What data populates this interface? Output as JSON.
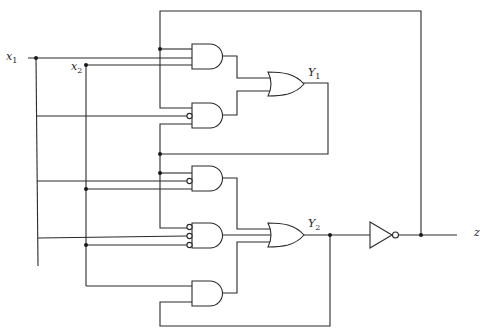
{
  "diagram": {
    "type": "logic-circuit",
    "inputs": [
      {
        "id": "x1",
        "name": "x",
        "sub": "1"
      },
      {
        "id": "x2",
        "name": "x",
        "sub": "2"
      }
    ],
    "state_outputs": [
      {
        "id": "Y1",
        "name": "Y",
        "sub": "1"
      },
      {
        "id": "Y2",
        "name": "Y",
        "sub": "2"
      }
    ],
    "output": {
      "id": "z",
      "name": "z"
    },
    "gates": [
      {
        "id": "and1",
        "type": "AND",
        "inputs": [
          "y1_feedback",
          "x1",
          "x2"
        ]
      },
      {
        "id": "and2",
        "type": "AND",
        "inputs": [
          "y1_feedback",
          "NOT x1",
          "y2_feedback"
        ]
      },
      {
        "id": "or1",
        "type": "OR",
        "inputs": [
          "and1",
          "and2"
        ],
        "output": "Y1"
      },
      {
        "id": "and3",
        "type": "AND",
        "inputs": [
          "y2_feedback",
          "NOT x1",
          "x2"
        ]
      },
      {
        "id": "and4",
        "type": "AND",
        "inputs": [
          "NOT y2_feedback",
          "NOT x1",
          "NOT x2"
        ]
      },
      {
        "id": "and5",
        "type": "AND",
        "inputs": [
          "x2",
          "Y2"
        ]
      },
      {
        "id": "or2",
        "type": "OR",
        "inputs": [
          "and3",
          "and4",
          "and5"
        ],
        "output": "Y2"
      },
      {
        "id": "not1",
        "type": "NOT",
        "inputs": [
          "Y2"
        ],
        "output": "z"
      }
    ]
  }
}
